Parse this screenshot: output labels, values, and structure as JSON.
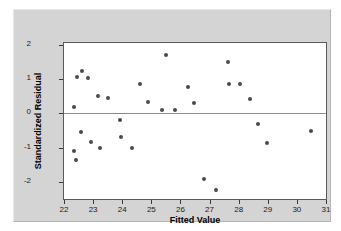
{
  "chart_data": {
    "type": "scatter",
    "title": "",
    "xlabel": "Fitted Value",
    "ylabel": "Standardized Residual",
    "xlim": [
      22,
      31
    ],
    "ylim": [
      -2.5,
      2.05
    ],
    "xticks": [
      22,
      23,
      24,
      25,
      26,
      27,
      28,
      29,
      30,
      31
    ],
    "yticks": [
      2,
      1,
      0,
      -1,
      -2
    ],
    "xticklabels": [
      "22",
      "23",
      "24",
      "25",
      "26",
      "27",
      "28",
      "29",
      "30",
      "31"
    ],
    "yticklabels": [
      "2",
      "1",
      "0",
      "-1",
      "-2"
    ],
    "grid": false,
    "legend": null,
    "reference_lines": [
      {
        "name": "zero-line",
        "axis": "y",
        "value": 0
      }
    ],
    "marker": {
      "shape": "circle",
      "color": "#4a4a4a",
      "size": 4
    },
    "points": [
      {
        "x": 22.35,
        "y": 0.17
      },
      {
        "x": 22.43,
        "y": 1.05
      },
      {
        "x": 22.62,
        "y": 1.22
      },
      {
        "x": 22.82,
        "y": 1.03
      },
      {
        "x": 23.18,
        "y": 0.51
      },
      {
        "x": 23.52,
        "y": 0.45
      },
      {
        "x": 24.62,
        "y": 0.86
      },
      {
        "x": 24.87,
        "y": 0.34
      },
      {
        "x": 25.35,
        "y": 0.1
      },
      {
        "x": 25.52,
        "y": 1.71
      },
      {
        "x": 25.8,
        "y": 0.11
      },
      {
        "x": 26.27,
        "y": 0.78
      },
      {
        "x": 26.45,
        "y": 0.29
      },
      {
        "x": 27.65,
        "y": 1.5
      },
      {
        "x": 27.67,
        "y": 0.86
      },
      {
        "x": 28.05,
        "y": 0.85
      },
      {
        "x": 28.4,
        "y": 0.41
      },
      {
        "x": 22.34,
        "y": -1.11
      },
      {
        "x": 22.42,
        "y": -1.36
      },
      {
        "x": 22.6,
        "y": -0.56
      },
      {
        "x": 22.92,
        "y": -0.85
      },
      {
        "x": 23.22,
        "y": -1.0
      },
      {
        "x": 23.93,
        "y": -0.19
      },
      {
        "x": 23.97,
        "y": -0.68
      },
      {
        "x": 24.35,
        "y": -1.01
      },
      {
        "x": 26.8,
        "y": -1.91
      },
      {
        "x": 27.23,
        "y": -2.25
      },
      {
        "x": 28.68,
        "y": -0.32
      },
      {
        "x": 28.98,
        "y": -0.86
      },
      {
        "x": 30.5,
        "y": -0.51
      }
    ]
  },
  "colors": {
    "page_background": "#ffffff",
    "panel_background": "#d4d4d4",
    "plot_background": "#ffffff",
    "frame": "#5a5a5a",
    "marker": "#4a4a4a",
    "zero_line": "#8f8f8f",
    "text": "#000000"
  }
}
